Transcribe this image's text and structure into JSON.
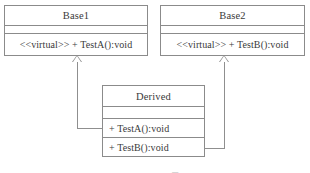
{
  "diagram": {
    "type": "uml-class-diagram",
    "background_color": "#ffffff",
    "line_color": "#8f8f8f",
    "text_color": "#3a3a3a",
    "classes": [
      {
        "id": "base1",
        "name": "Base1",
        "attributes": [],
        "attributes_text": "",
        "operations": [
          "<<virtual>> + TestA():void"
        ]
      },
      {
        "id": "base2",
        "name": "Base2",
        "attributes": [],
        "attributes_text": "",
        "operations": [
          "<<virtual>> + TestB():void"
        ]
      },
      {
        "id": "derived",
        "name": "Derived",
        "attributes": [],
        "attributes_text": "",
        "operations": [
          "+ TestA():void",
          "+ TestB():void"
        ]
      }
    ],
    "relationships": [
      {
        "id": "gen-derived-base1",
        "kind": "generalization",
        "from": "Derived",
        "to": "Base1",
        "arrow": "hollow-triangle"
      },
      {
        "id": "gen-derived-base2",
        "kind": "generalization",
        "from": "Derived",
        "to": "Base2",
        "arrow": "hollow-triangle"
      }
    ],
    "caption": "― ―― ―▄"
  }
}
